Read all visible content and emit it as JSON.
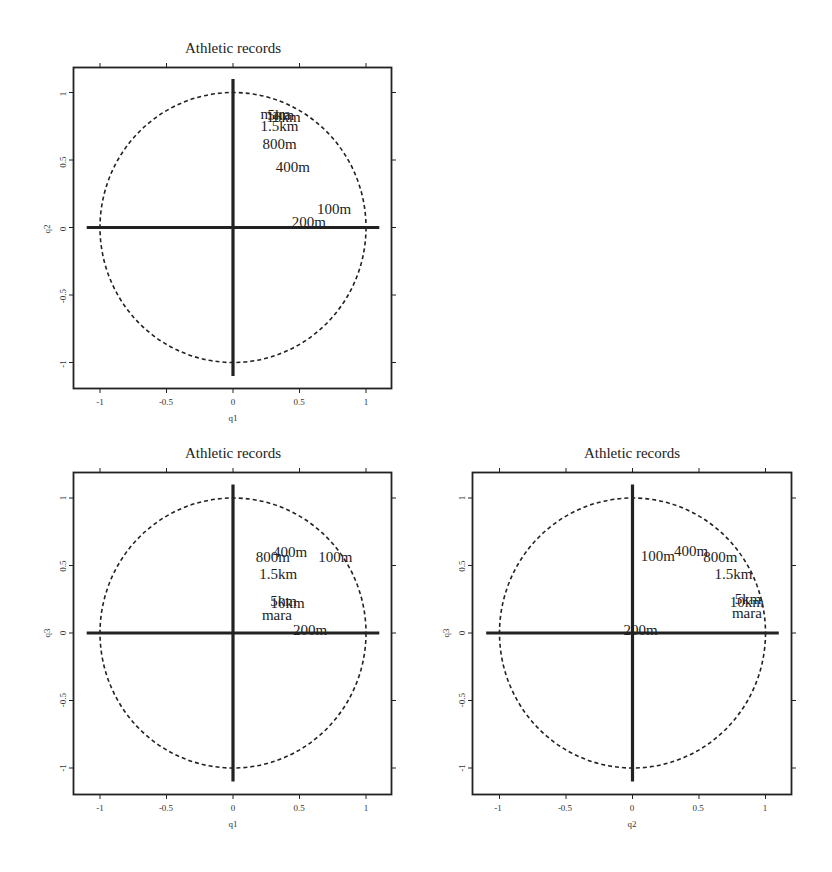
{
  "figure": {
    "background": "#ffffff",
    "ink": "#222222"
  },
  "chart_data": [
    {
      "type": "scatter",
      "title": "Athletic records",
      "xlabel": "q1",
      "ylabel": "q2",
      "xlim": [
        -1.2,
        1.2
      ],
      "ylim": [
        -1.2,
        1.2
      ],
      "xticks": [
        "-1",
        "-0.5",
        "0",
        "0.5",
        "1"
      ],
      "yticks": [
        "-1",
        "-0.5",
        "0",
        "0.5",
        "1"
      ],
      "grid": false,
      "unit_circle": "dashed",
      "axes_lines": "thick solid through origin",
      "points": [
        {
          "label": "mara",
          "x": 0.32,
          "y": 0.84
        },
        {
          "label": "5km",
          "x": 0.36,
          "y": 0.83
        },
        {
          "label": "10km",
          "x": 0.38,
          "y": 0.82
        },
        {
          "label": "1.5km",
          "x": 0.35,
          "y": 0.75
        },
        {
          "label": "800m",
          "x": 0.35,
          "y": 0.62
        },
        {
          "label": "400m",
          "x": 0.45,
          "y": 0.45
        },
        {
          "label": "100m",
          "x": 0.76,
          "y": 0.14
        },
        {
          "label": "200m",
          "x": 0.57,
          "y": 0.04
        }
      ]
    },
    {
      "type": "scatter",
      "title": "Athletic records",
      "xlabel": "q1",
      "ylabel": "q3",
      "xlim": [
        -1.2,
        1.2
      ],
      "ylim": [
        -1.2,
        1.2
      ],
      "xticks": [
        "-1",
        "-0.5",
        "0",
        "0.5",
        "1"
      ],
      "yticks": [
        "-1",
        "-0.5",
        "0",
        "0.5",
        "1"
      ],
      "grid": false,
      "unit_circle": "dashed",
      "axes_lines": "thick solid through origin",
      "points": [
        {
          "label": "400m",
          "x": 0.43,
          "y": 0.6
        },
        {
          "label": "800m",
          "x": 0.3,
          "y": 0.56
        },
        {
          "label": "100m",
          "x": 0.77,
          "y": 0.56
        },
        {
          "label": "1.5km",
          "x": 0.34,
          "y": 0.44
        },
        {
          "label": "5km",
          "x": 0.38,
          "y": 0.24
        },
        {
          "label": "10km",
          "x": 0.41,
          "y": 0.22
        },
        {
          "label": "mara",
          "x": 0.33,
          "y": 0.13
        },
        {
          "label": "200m",
          "x": 0.58,
          "y": 0.02
        }
      ]
    },
    {
      "type": "scatter",
      "title": "Athletic records",
      "xlabel": "q2",
      "ylabel": "q3",
      "xlim": [
        -1.2,
        1.2
      ],
      "ylim": [
        -1.2,
        1.2
      ],
      "xticks": [
        "-1",
        "-0.5",
        "0",
        "0.5",
        "1"
      ],
      "yticks": [
        "-1",
        "-0.5",
        "0",
        "0.5",
        "1"
      ],
      "grid": false,
      "unit_circle": "dashed",
      "axes_lines": "thick solid through origin",
      "points": [
        {
          "label": "100m",
          "x": 0.19,
          "y": 0.57
        },
        {
          "label": "400m",
          "x": 0.44,
          "y": 0.61
        },
        {
          "label": "800m",
          "x": 0.66,
          "y": 0.56
        },
        {
          "label": "1.5km",
          "x": 0.76,
          "y": 0.44
        },
        {
          "label": "5km",
          "x": 0.87,
          "y": 0.25
        },
        {
          "label": "10km",
          "x": 0.86,
          "y": 0.23
        },
        {
          "label": "mara",
          "x": 0.86,
          "y": 0.15
        },
        {
          "label": "200m",
          "x": 0.06,
          "y": 0.02
        }
      ]
    }
  ],
  "panels": [
    {
      "id": "q1-q2",
      "chart_index": 0
    },
    {
      "id": "q1-q3",
      "chart_index": 1
    },
    {
      "id": "q2-q3",
      "chart_index": 2
    }
  ]
}
